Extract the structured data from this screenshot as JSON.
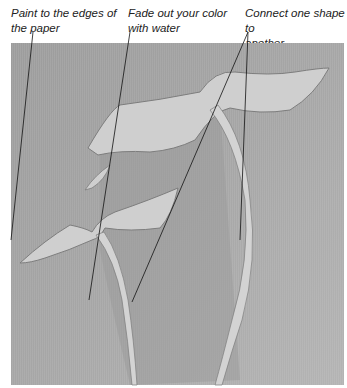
{
  "annotations": [
    {
      "label": "Paint to the edges of\nthe paper"
    },
    {
      "label": "Fade out your color\nwith water"
    },
    {
      "label": "Connect one shape to\nanother"
    }
  ],
  "painting": {
    "description": "Watercolor plant with pale leaves and stems on grey wash",
    "background_color": "#a9a9a9",
    "leaf_color": "#cfcfcf",
    "stroke_color": "#7d7d7d"
  }
}
